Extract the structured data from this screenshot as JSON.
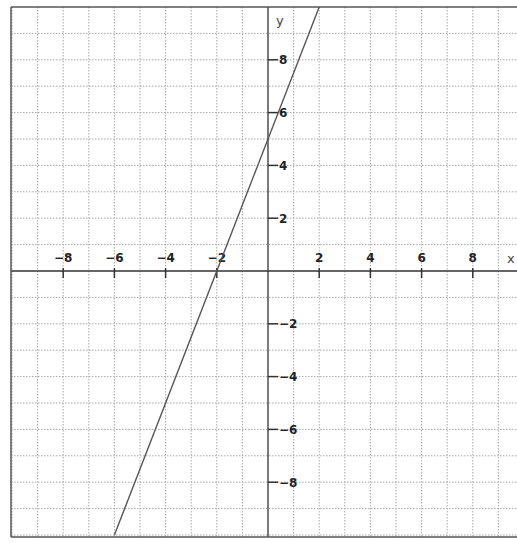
{
  "chart_data": {
    "type": "line",
    "title": "",
    "xlabel": "x",
    "ylabel": "y",
    "xlim": [
      -10,
      9.5
    ],
    "ylim": [
      -10,
      10
    ],
    "grid": true,
    "grid_style": "dotted",
    "grid_step": 1,
    "x_ticks": [
      -8,
      -6,
      -4,
      -2,
      2,
      4,
      6,
      8
    ],
    "y_ticks": [
      8,
      6,
      4,
      2,
      -2,
      -4,
      -6,
      -8
    ],
    "series": [
      {
        "name": "line",
        "equation": "y = 2.5x + 5",
        "slope": 2.5,
        "intercept": 5,
        "x_intercept": -2,
        "points": [
          [
            -6,
            -10
          ],
          [
            -2,
            0
          ],
          [
            0,
            5
          ],
          [
            2,
            10
          ]
        ],
        "color": "#555555"
      }
    ],
    "legend": null
  },
  "colors": {
    "axis": "#333333",
    "grid": "#aaaaaa",
    "border": "#555555",
    "line": "#555555"
  }
}
